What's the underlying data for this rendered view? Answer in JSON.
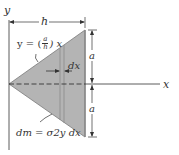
{
  "figure": {
    "labels": {
      "y_axis": "y",
      "x_axis": "x",
      "width": "h",
      "upper_half": "a",
      "lower_half": "a",
      "strip_width": "dx",
      "edge_equation_lhs": "y = (",
      "edge_equation_num": "a",
      "edge_equation_den": "h",
      "edge_equation_rhs": ") x",
      "mass_element": "dm = σ2y dx"
    },
    "colors": {
      "plate_fill": "#b4b4b4",
      "plate_edge": "#7a7a7a",
      "line": "#333333",
      "background": "#ffffff"
    },
    "geometry": {
      "apex": [
        9,
        84
      ],
      "top_right": [
        85,
        30
      ],
      "bottom_right": [
        85,
        137
      ],
      "strip_x": [
        60,
        64
      ]
    }
  }
}
